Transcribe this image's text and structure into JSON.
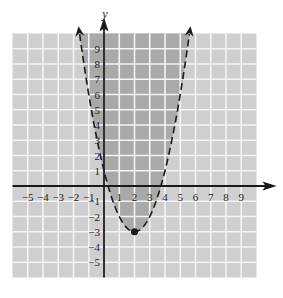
{
  "chart_data": {
    "type": "line",
    "title": "",
    "xlabel": "x",
    "ylabel": "y",
    "xlim": [
      -6,
      10
    ],
    "ylim": [
      -6,
      10
    ],
    "grid": true,
    "x_ticks": [
      -5,
      -4,
      -3,
      -2,
      -1,
      1,
      2,
      3,
      4,
      5,
      6,
      7,
      8,
      9
    ],
    "y_ticks": [
      9,
      8,
      7,
      6,
      5,
      4,
      3,
      2,
      1,
      -1,
      -2,
      -3,
      -4,
      -5
    ],
    "series": [
      {
        "name": "boundary",
        "equation": "y = (x - 2)^2 - 3",
        "style": "dashed",
        "x": [
          -1.6,
          -1,
          0,
          1,
          2,
          3,
          4,
          5,
          5.6
        ],
        "y": [
          9.96,
          6,
          1,
          -2,
          -3,
          -2,
          1,
          6,
          9.96
        ]
      }
    ],
    "vertex": {
      "x": 2,
      "y": -3,
      "marker": "filled-circle"
    },
    "shaded_region": "inside parabola (y > boundary)",
    "colors": {
      "grid_background": "#cfcfcf",
      "shaded": "#a9a9a9",
      "grid_lines": "#f4f4f4",
      "axes": "#1a1a1a",
      "curve": "#1a1a1a"
    }
  },
  "axes": {
    "x_label": "x",
    "y_label": "y"
  }
}
